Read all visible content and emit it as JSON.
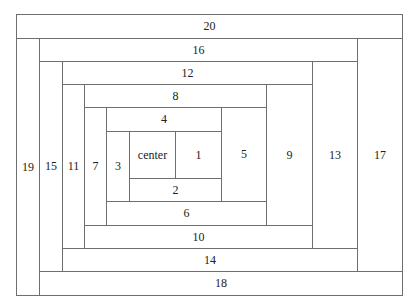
{
  "line_color": "#6e6e6e",
  "blocks": [
    {
      "label": "20",
      "x1": 16,
      "y1": 14,
      "x2": 402,
      "y2": 38
    },
    {
      "label": "19",
      "x1": 16,
      "y1": 38,
      "x2": 39,
      "y2": 295
    },
    {
      "label": "18",
      "x1": 39,
      "y1": 271,
      "x2": 402,
      "y2": 295
    },
    {
      "label": "17",
      "x1": 357,
      "y1": 38,
      "x2": 402,
      "y2": 271
    },
    {
      "label": "16",
      "x1": 39,
      "y1": 38,
      "x2": 357,
      "y2": 61
    },
    {
      "label": "15",
      "x1": 39,
      "y1": 61,
      "x2": 62,
      "y2": 271
    },
    {
      "label": "14",
      "x1": 62,
      "y1": 248,
      "x2": 357,
      "y2": 271
    },
    {
      "label": "13",
      "x1": 312,
      "y1": 61,
      "x2": 357,
      "y2": 248
    },
    {
      "label": "12",
      "x1": 62,
      "y1": 61,
      "x2": 312,
      "y2": 84
    },
    {
      "label": "11",
      "x1": 62,
      "y1": 84,
      "x2": 84,
      "y2": 248
    },
    {
      "label": "10",
      "x1": 84,
      "y1": 225,
      "x2": 312,
      "y2": 248
    },
    {
      "label": "9",
      "x1": 266,
      "y1": 84,
      "x2": 312,
      "y2": 225
    },
    {
      "label": "8",
      "x1": 84,
      "y1": 84,
      "x2": 266,
      "y2": 107
    },
    {
      "label": "7",
      "x1": 84,
      "y1": 107,
      "x2": 106,
      "y2": 225
    },
    {
      "label": "6",
      "x1": 106,
      "y1": 201,
      "x2": 266,
      "y2": 225
    },
    {
      "label": "5",
      "x1": 221,
      "y1": 107,
      "x2": 266,
      "y2": 201
    },
    {
      "label": "4",
      "x1": 106,
      "y1": 107,
      "x2": 221,
      "y2": 131
    },
    {
      "label": "3",
      "x1": 106,
      "y1": 131,
      "x2": 129,
      "y2": 201
    },
    {
      "label": "2",
      "x1": 129,
      "y1": 178,
      "x2": 221,
      "y2": 201
    },
    {
      "label": "1",
      "x1": 175,
      "y1": 131,
      "x2": 221,
      "y2": 178
    },
    {
      "label": "center",
      "x1": 129,
      "y1": 131,
      "x2": 175,
      "y2": 178
    }
  ]
}
